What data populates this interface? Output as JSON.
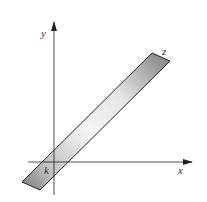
{
  "diagram": {
    "axes": {
      "x_label": "x",
      "y_label": "y",
      "origin": [
        54,
        162
      ],
      "x_axis": {
        "start": [
          28,
          162
        ],
        "end": [
          192,
          162
        ]
      },
      "y_axis": {
        "start": [
          54,
          195
        ],
        "end": [
          54,
          22
        ]
      }
    },
    "strip": {
      "corners": [
        [
          22,
          182
        ],
        [
          152,
          53
        ],
        [
          170,
          61
        ],
        [
          40,
          190
        ]
      ],
      "fill_dark": "#8a8a8a",
      "fill_light": "#f2f2f2",
      "stroke": "#222222"
    },
    "labels": {
      "z": "z",
      "k": "k"
    }
  }
}
